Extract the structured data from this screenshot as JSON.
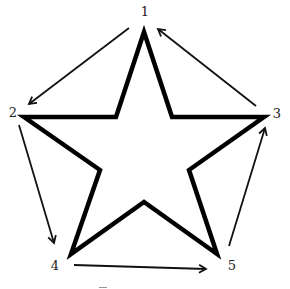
{
  "diagram": {
    "title": "",
    "nodes": [
      {
        "id": "1",
        "label": "1",
        "x": 145,
        "y": 15
      },
      {
        "id": "2",
        "label": "2",
        "x": 13,
        "y": 117
      },
      {
        "id": "3",
        "label": "3",
        "x": 277,
        "y": 118
      },
      {
        "id": "4",
        "label": "4",
        "x": 55,
        "y": 270
      },
      {
        "id": "5",
        "label": "5",
        "x": 232,
        "y": 270
      }
    ],
    "edges": [
      {
        "from": "1",
        "to": "2"
      },
      {
        "from": "2",
        "to": "4"
      },
      {
        "from": "4",
        "to": "5"
      },
      {
        "from": "5",
        "to": "3"
      },
      {
        "from": "3",
        "to": "1"
      }
    ],
    "shape": "five-pointed star (outline)",
    "colors": {
      "stroke": "#000000",
      "background": "#ffffff",
      "label": "#222222"
    }
  }
}
